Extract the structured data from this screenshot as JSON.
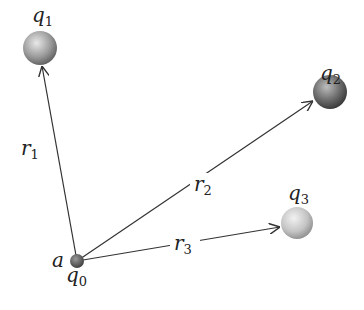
{
  "diagram": {
    "origin": {
      "charge": "q",
      "charge_sub": "0",
      "point": "a"
    },
    "charges": [
      {
        "name": "q",
        "sub": "1"
      },
      {
        "name": "q",
        "sub": "2"
      },
      {
        "name": "q",
        "sub": "3"
      }
    ],
    "vectors": [
      {
        "name": "r",
        "sub": "1"
      },
      {
        "name": "r",
        "sub": "2"
      },
      {
        "name": "r",
        "sub": "3"
      }
    ],
    "colors": {
      "line": "#333333",
      "sphere_dark": "#4a4a4a",
      "sphere_light": "#d8d8d8"
    }
  }
}
